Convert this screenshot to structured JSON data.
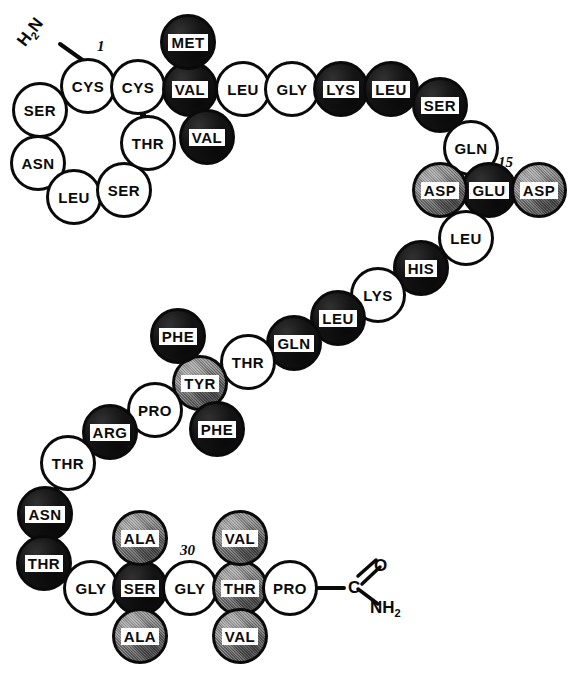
{
  "figure": {
    "type": "peptide-sequence-bead-diagram",
    "n_terminus_label": "H2N",
    "c_terminus": {
      "carbon": "C",
      "oxygen": "O",
      "amide": "NH2"
    },
    "position_numbers": [
      {
        "id": "num-1",
        "text": "1",
        "x": 97,
        "y": 38
      },
      {
        "id": "num-15",
        "text": "15",
        "x": 498,
        "y": 154
      },
      {
        "id": "num-30",
        "text": "30",
        "x": 180,
        "y": 542
      }
    ],
    "legend_shades": {
      "white": "#ffffff",
      "black": "#131313",
      "gray": "#8d8d8d",
      "outline": "#0a0a0a"
    },
    "sequence": [
      {
        "n": 1,
        "label": "CYS",
        "shade": "white",
        "cx": 88,
        "cy": 86,
        "r": 28
      },
      {
        "n": 2,
        "label": "CYS",
        "shade": "white",
        "cx": 138,
        "cy": 87,
        "r": 28
      },
      {
        "n": 3,
        "label": "VAL",
        "shade": "black",
        "cx": 190,
        "cy": 89,
        "r": 28
      },
      {
        "n": 4,
        "label": "LEU",
        "shade": "white",
        "cx": 243,
        "cy": 89,
        "r": 28
      },
      {
        "n": 5,
        "label": "GLY",
        "shade": "white",
        "cx": 292,
        "cy": 89,
        "r": 28
      },
      {
        "n": 6,
        "label": "LYS",
        "shade": "black",
        "cx": 341,
        "cy": 89,
        "r": 28
      },
      {
        "n": 7,
        "label": "LEU",
        "shade": "black",
        "cx": 391,
        "cy": 89,
        "r": 28
      },
      {
        "n": 8,
        "label": "SER",
        "shade": "black",
        "cx": 440,
        "cy": 105,
        "r": 28
      },
      {
        "n": 9,
        "label": "GLN",
        "shade": "white",
        "cx": 471,
        "cy": 148,
        "r": 28
      },
      {
        "n": 10,
        "label": "GLU",
        "shade": "black",
        "cx": 489,
        "cy": 190,
        "r": 28
      },
      {
        "n": 11,
        "label": "LEU",
        "shade": "white",
        "cx": 466,
        "cy": 238,
        "r": 28
      },
      {
        "n": 12,
        "label": "HIS",
        "shade": "black",
        "cx": 421,
        "cy": 268,
        "r": 28
      },
      {
        "n": 13,
        "label": "LYS",
        "shade": "white",
        "cx": 378,
        "cy": 295,
        "r": 28
      },
      {
        "n": 14,
        "label": "LEU",
        "shade": "black",
        "cx": 338,
        "cy": 318,
        "r": 28
      },
      {
        "n": 15,
        "label": "GLN",
        "shade": "black",
        "cx": 294,
        "cy": 343,
        "r": 28
      },
      {
        "n": 16,
        "label": "THR",
        "shade": "white",
        "cx": 248,
        "cy": 362,
        "r": 28
      },
      {
        "n": 17,
        "label": "TYR",
        "shade": "gray",
        "cx": 200,
        "cy": 383,
        "r": 28
      },
      {
        "n": 18,
        "label": "PRO",
        "shade": "white",
        "cx": 155,
        "cy": 410,
        "r": 28
      },
      {
        "n": 19,
        "label": "ARG",
        "shade": "black",
        "cx": 110,
        "cy": 432,
        "r": 28
      },
      {
        "n": 20,
        "label": "THR",
        "shade": "white",
        "cx": 68,
        "cy": 463,
        "r": 28
      },
      {
        "n": 21,
        "label": "ASN",
        "shade": "black",
        "cx": 45,
        "cy": 514,
        "r": 28
      },
      {
        "n": 22,
        "label": "THR",
        "shade": "black",
        "cx": 44,
        "cy": 563,
        "r": 28
      },
      {
        "n": 23,
        "label": "GLY",
        "shade": "white",
        "cx": 91,
        "cy": 588,
        "r": 28
      },
      {
        "n": 24,
        "label": "SER",
        "shade": "black",
        "cx": 140,
        "cy": 588,
        "r": 28
      },
      {
        "n": 25,
        "label": "GLY",
        "shade": "white",
        "cx": 190,
        "cy": 588,
        "r": 28
      },
      {
        "n": 26,
        "label": "THR",
        "shade": "gray",
        "cx": 240,
        "cy": 588,
        "r": 28
      },
      {
        "n": 27,
        "label": "PRO",
        "shade": "white",
        "cx": 290,
        "cy": 588,
        "r": 28
      }
    ],
    "branch_residues": [
      {
        "id": "ser-upper-left",
        "label": "SER",
        "shade": "white",
        "cx": 40,
        "cy": 110,
        "r": 28
      },
      {
        "id": "asn-upper-left",
        "label": "ASN",
        "shade": "white",
        "cx": 38,
        "cy": 163,
        "r": 28
      },
      {
        "id": "leu-upper-left",
        "label": "LEU",
        "shade": "white",
        "cx": 74,
        "cy": 197,
        "r": 28
      },
      {
        "id": "ser-lower-left",
        "label": "SER",
        "shade": "white",
        "cx": 124,
        "cy": 190,
        "r": 28
      },
      {
        "id": "thr-upper-mid",
        "label": "THR",
        "shade": "white",
        "cx": 148,
        "cy": 143,
        "r": 28
      },
      {
        "id": "met-top",
        "label": "MET",
        "shade": "black",
        "cx": 188,
        "cy": 42,
        "r": 28
      },
      {
        "id": "val-below",
        "label": "VAL",
        "shade": "black",
        "cx": 207,
        "cy": 137,
        "r": 28
      },
      {
        "id": "asp-left",
        "label": "ASP",
        "shade": "gray",
        "cx": 440,
        "cy": 190,
        "r": 28
      },
      {
        "id": "asp-right",
        "label": "ASP",
        "shade": "gray",
        "cx": 539,
        "cy": 190,
        "r": 28
      },
      {
        "id": "phe-upper",
        "label": "PHE",
        "shade": "black",
        "cx": 178,
        "cy": 336,
        "r": 28
      },
      {
        "id": "phe-lower",
        "label": "PHE",
        "shade": "black",
        "cx": 217,
        "cy": 429,
        "r": 28
      },
      {
        "id": "ala-upper",
        "label": "ALA",
        "shade": "gray",
        "cx": 140,
        "cy": 538,
        "r": 28
      },
      {
        "id": "ala-lower",
        "label": "ALA",
        "shade": "gray",
        "cx": 140,
        "cy": 636,
        "r": 28
      },
      {
        "id": "val-upper",
        "label": "VAL",
        "shade": "gray",
        "cx": 240,
        "cy": 538,
        "r": 28
      },
      {
        "id": "val-lower",
        "label": "VAL",
        "shade": "gray",
        "cx": 240,
        "cy": 636,
        "r": 28
      }
    ],
    "bonds": [
      [
        88,
        86,
        40,
        110
      ],
      [
        40,
        110,
        38,
        163
      ],
      [
        38,
        163,
        74,
        197
      ],
      [
        74,
        197,
        124,
        190
      ],
      [
        124,
        190,
        148,
        143
      ],
      [
        148,
        143,
        138,
        87
      ],
      [
        88,
        86,
        138,
        87
      ],
      [
        188,
        42,
        190,
        89
      ],
      [
        190,
        89,
        207,
        137
      ],
      [
        138,
        87,
        190,
        89
      ],
      [
        190,
        89,
        243,
        89
      ],
      [
        243,
        89,
        292,
        89
      ],
      [
        292,
        89,
        341,
        89
      ],
      [
        341,
        89,
        391,
        89
      ],
      [
        391,
        89,
        440,
        105
      ],
      [
        440,
        105,
        471,
        148
      ],
      [
        471,
        148,
        489,
        190
      ],
      [
        440,
        190,
        489,
        190
      ],
      [
        489,
        190,
        539,
        190
      ],
      [
        489,
        190,
        466,
        238
      ],
      [
        466,
        238,
        421,
        268
      ],
      [
        421,
        268,
        378,
        295
      ],
      [
        378,
        295,
        338,
        318
      ],
      [
        338,
        318,
        294,
        343
      ],
      [
        294,
        343,
        248,
        362
      ],
      [
        248,
        362,
        200,
        383
      ],
      [
        200,
        383,
        178,
        336
      ],
      [
        200,
        383,
        217,
        429
      ],
      [
        200,
        383,
        155,
        410
      ],
      [
        155,
        410,
        110,
        432
      ],
      [
        110,
        432,
        68,
        463
      ],
      [
        68,
        463,
        45,
        514
      ],
      [
        45,
        514,
        44,
        563
      ],
      [
        44,
        563,
        91,
        588
      ],
      [
        91,
        588,
        140,
        588
      ],
      [
        140,
        588,
        140,
        538
      ],
      [
        140,
        588,
        140,
        636
      ],
      [
        140,
        588,
        190,
        588
      ],
      [
        190,
        588,
        240,
        588
      ],
      [
        240,
        588,
        240,
        538
      ],
      [
        240,
        588,
        240,
        636
      ],
      [
        240,
        588,
        290,
        588
      ]
    ],
    "nterm_bond": [
      60,
      44,
      88,
      64
    ],
    "cterm": {
      "bond_from": [
        318,
        588
      ],
      "bond_to": [
        344,
        588
      ],
      "c_x": 348,
      "c_y": 578,
      "o_x": 374,
      "o_y": 556,
      "nh2_x": 370,
      "nh2_y": 598,
      "dbl_line_a": [
        358,
        576,
        376,
        560
      ],
      "dbl_line_b": [
        362,
        584,
        380,
        567
      ],
      "n_line": [
        358,
        589,
        378,
        604
      ]
    }
  }
}
